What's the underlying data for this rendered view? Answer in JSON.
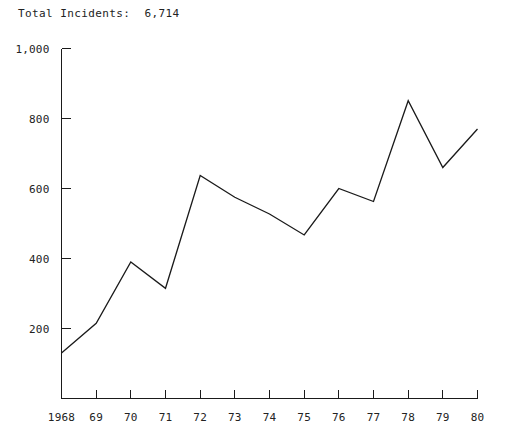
{
  "title": "Total Incidents:  6,714",
  "chart_data": {
    "type": "line",
    "title": "Total Incidents:  6,714",
    "xlabel": "",
    "ylabel": "",
    "grid": false,
    "legend": "none",
    "line_color": "#1a1a1a",
    "categories": [
      "1968",
      "69",
      "70",
      "71",
      "72",
      "73",
      "74",
      "75",
      "76",
      "77",
      "78",
      "79",
      "80"
    ],
    "x": [
      1968,
      1969,
      1970,
      1971,
      1972,
      1973,
      1974,
      1975,
      1976,
      1977,
      1978,
      1979,
      1980
    ],
    "values": [
      130,
      215,
      390,
      315,
      637,
      575,
      527,
      467,
      600,
      563,
      851,
      660,
      770
    ],
    "ylim": [
      0,
      1000
    ],
    "yticks": [
      200,
      400,
      600,
      800,
      1000
    ],
    "ytick_labels": [
      "200",
      "400",
      "600",
      "800",
      "1,000"
    ],
    "xtick_labels": [
      "1968",
      "69",
      "70",
      "71",
      "72",
      "73",
      "74",
      "75",
      "76",
      "77",
      "78",
      "79",
      "80"
    ]
  }
}
